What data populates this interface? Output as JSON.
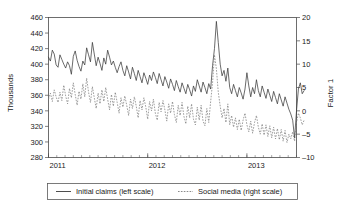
{
  "chart_data": {
    "type": "line",
    "title": "",
    "subtitle": "",
    "xlabel": "",
    "ylabel": "Thousands",
    "y2label": "Factor 1",
    "grid": false,
    "legend_position": "bottom",
    "x_tick_labels": [
      "2011",
      "2012",
      "2013"
    ],
    "x_tick_values": [
      0,
      52,
      104
    ],
    "xlim": [
      0,
      130
    ],
    "ylim": [
      280,
      460
    ],
    "y_ticks": [
      280,
      300,
      320,
      340,
      360,
      380,
      400,
      420,
      440,
      460
    ],
    "y2lim": [
      -10,
      20
    ],
    "y2_ticks": [
      -10,
      -5,
      0,
      5,
      10,
      15,
      20
    ],
    "x_minor_tick_interval_weeks": 4.333,
    "series": [
      {
        "name": "Initial claims (left scale)",
        "axis": "left",
        "style": "solid",
        "color": "#3a3a3a",
        "values": [
          409,
          404,
          418,
          413,
          399,
          396,
          412,
          406,
          400,
          395,
          403,
          398,
          387,
          410,
          417,
          405,
          397,
          391,
          404,
          399,
          421,
          412,
          403,
          428,
          413,
          398,
          409,
          401,
          392,
          408,
          400,
          418,
          409,
          399,
          404,
          396,
          389,
          397,
          403,
          392,
          385,
          398,
          390,
          381,
          396,
          388,
          379,
          392,
          384,
          376,
          389,
          382,
          374,
          386,
          379,
          390,
          383,
          375,
          388,
          380,
          372,
          384,
          377,
          369,
          381,
          374,
          366,
          379,
          371,
          364,
          376,
          369,
          362,
          374,
          367,
          359,
          372,
          365,
          380,
          372,
          364,
          377,
          370,
          362,
          375,
          368,
          398,
          420,
          455,
          428,
          400,
          385,
          392,
          378,
          395,
          370,
          362,
          374,
          366,
          358,
          370,
          363,
          355,
          368,
          389,
          372,
          358,
          370,
          362,
          380,
          366,
          358,
          372,
          364,
          356,
          368,
          360,
          352,
          365,
          357,
          349,
          362,
          354,
          346,
          358,
          350,
          342,
          336,
          328,
          305,
          340,
          368,
          376,
          362,
          366
        ]
      },
      {
        "name": "Social media (right scale)",
        "axis": "right",
        "style": "dashed",
        "color": "#7d7d7d",
        "values": [
          2.5,
          3.8,
          2.0,
          4.5,
          3.0,
          1.8,
          4.0,
          2.2,
          5.5,
          3.2,
          1.5,
          4.8,
          2.8,
          6.0,
          3.5,
          1.2,
          4.2,
          2.5,
          5.8,
          3.0,
          7.0,
          4.0,
          1.8,
          5.2,
          2.8,
          0.5,
          3.8,
          1.5,
          4.5,
          2.0,
          5.0,
          2.5,
          0.2,
          3.5,
          1.0,
          4.0,
          1.8,
          -0.5,
          2.8,
          0.8,
          3.2,
          1.2,
          -1.0,
          2.5,
          0.5,
          3.0,
          1.0,
          -1.5,
          2.2,
          0.2,
          2.8,
          0.8,
          -1.8,
          2.0,
          0.0,
          2.5,
          -0.5,
          -2.0,
          1.8,
          -0.2,
          2.2,
          0.2,
          -2.2,
          1.5,
          -0.5,
          2.0,
          -0.8,
          -2.5,
          1.2,
          -1.0,
          1.8,
          -1.2,
          -2.8,
          1.0,
          -1.5,
          1.5,
          -1.8,
          -3.0,
          0.8,
          -2.0,
          1.2,
          -2.2,
          -3.2,
          0.5,
          -2.5,
          2.0,
          6.0,
          12.0,
          9.0,
          4.0,
          1.0,
          -1.5,
          0.5,
          -2.5,
          1.5,
          -3.0,
          -1.0,
          -3.5,
          -1.5,
          -4.0,
          -1.8,
          -4.2,
          -2.0,
          -0.5,
          -3.0,
          -4.5,
          -2.2,
          -4.8,
          -2.5,
          -1.0,
          -3.5,
          -5.0,
          -2.8,
          -5.2,
          -3.0,
          -5.5,
          -3.2,
          -5.8,
          -3.5,
          -6.0,
          -3.8,
          -6.2,
          -4.0,
          -6.5,
          -4.2,
          -6.8,
          -5.0,
          -6.0,
          -4.5,
          -6.5,
          -2.5,
          -0.5,
          -1.5,
          -3.0,
          -2.0
        ]
      }
    ]
  },
  "legend": {
    "entries": [
      {
        "label": "Initial claims (left scale)",
        "style": "solid"
      },
      {
        "label": "Social media (right scale)",
        "style": "dashed"
      }
    ]
  }
}
